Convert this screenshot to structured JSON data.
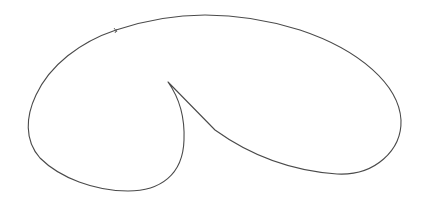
{
  "figure": {
    "stroke_color": "#4a4a4a",
    "background_color": "#ffffff",
    "key_points": {
      "cusp_tip": [
        168,
        82
      ],
      "top_peak": [
        205,
        15
      ],
      "right_extreme": [
        401,
        120
      ],
      "left_extreme": [
        27,
        147
      ],
      "left_lobe_bottom": [
        128,
        191
      ],
      "right_lobe_bottom": [
        337,
        174
      ],
      "small_tick": [
        116,
        30
      ]
    }
  }
}
